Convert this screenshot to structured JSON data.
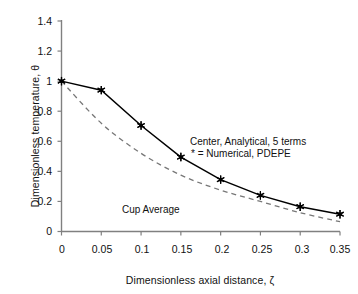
{
  "chart_data": {
    "type": "line",
    "title": "",
    "xlabel": "Dimensionless axial distance, ζ",
    "ylabel": "Dimensionless temperature, θ",
    "xlim": [
      0,
      0.35
    ],
    "ylim": [
      0,
      1.4
    ],
    "grid": false,
    "legend_position": "inside-annotation",
    "xticks": [
      "0",
      "0.05",
      "0.1",
      "0.15",
      "0.2",
      "0.25",
      "0.3",
      "0.35"
    ],
    "xtick_values": [
      0,
      0.05,
      0.1,
      0.15,
      0.2,
      0.25,
      0.3,
      0.35
    ],
    "yticks": [
      "0",
      "0.2",
      "0.4",
      "0.6",
      "0.8",
      "1",
      "1.2",
      "1.4"
    ],
    "ytick_values": [
      0,
      0.2,
      0.4,
      0.6,
      0.8,
      1.0,
      1.2,
      1.4
    ],
    "x": [
      0,
      0.05,
      0.1,
      0.15,
      0.2,
      0.25,
      0.3,
      0.35
    ],
    "series": [
      {
        "name": "Center, Analytical, 5 terms",
        "style": "solid-with-star-markers",
        "color": "#000000",
        "values": [
          1.0,
          0.94,
          0.705,
          0.495,
          0.345,
          0.24,
          0.165,
          0.115
        ]
      },
      {
        "name": "Cup Average",
        "style": "dashed",
        "color": "#666666",
        "values": [
          1.0,
          0.72,
          0.52,
          0.375,
          0.275,
          0.2,
          0.125,
          0.065
        ]
      }
    ],
    "annotations": [
      {
        "id": "center-annotation-line1",
        "text": "Center, Analytical, 5 terms",
        "x": 0.175,
        "y": 0.605
      },
      {
        "id": "center-annotation-line2",
        "text": "* = Numerical, PDEPE",
        "x": 0.175,
        "y": 0.525
      },
      {
        "id": "cup-average-annotation",
        "text": "Cup Average",
        "x": 0.1,
        "y": 0.205
      }
    ]
  },
  "axes": {
    "y_title": "Dimensionless temperature, θ",
    "x_title": "Dimensionless axial distance, ζ"
  },
  "labels": {
    "y": {
      "t0": "0",
      "t1": "0.2",
      "t2": "0.4",
      "t3": "0.6",
      "t4": "0.8",
      "t5": "1",
      "t6": "1.2",
      "t7": "1.4"
    },
    "x": {
      "t0": "0",
      "t1": "0.05",
      "t2": "0.1",
      "t3": "0.15",
      "t4": "0.2",
      "t5": "0.25",
      "t6": "0.3",
      "t7": "0.35"
    }
  },
  "annotations": {
    "center_line1": "Center, Analytical, 5 terms",
    "center_line2": "* = Numerical, PDEPE",
    "cup_average": "Cup Average"
  }
}
